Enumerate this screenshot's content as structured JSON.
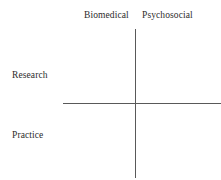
{
  "figure": {
    "background_color": "#ffffff",
    "axis_color": "#595959",
    "text_color": "#2b2b2b"
  },
  "chart_data": {
    "type": "diagram",
    "title": "",
    "subtitle": "",
    "xlabel": "",
    "ylabel": "",
    "axes": [
      {
        "name": "vertical-axis",
        "orientation": "vertical",
        "x": 135,
        "y_start": 29,
        "y_end": 178
      },
      {
        "name": "horizontal-axis",
        "orientation": "horizontal",
        "y": 103,
        "x_start": 63,
        "x_end": 221
      }
    ],
    "intersection": {
      "x": 135,
      "y": 103
    },
    "annotations": [
      {
        "name": "biomedical",
        "text": "Biomedical",
        "position": "top-left-of-vertical-axis"
      },
      {
        "name": "psychosocial",
        "text": "Psychosocial",
        "position": "top-right-of-vertical-axis"
      },
      {
        "name": "research",
        "text": "Research",
        "position": "left-above-horizontal-axis"
      },
      {
        "name": "practice",
        "text": "Practice",
        "position": "left-below-horizontal-axis"
      }
    ],
    "grid": false,
    "legend": null
  },
  "labels": {
    "biomedical": "Biomedical",
    "psychosocial": "Psychosocial",
    "research": "Research",
    "practice": "Practice"
  }
}
